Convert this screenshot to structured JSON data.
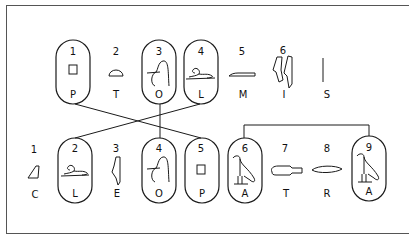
{
  "diagram": {
    "title": "",
    "top_row": [
      {
        "num": "1",
        "letter": "P",
        "glyph": "square-stool-icon",
        "cartouche": true,
        "x": 73
      },
      {
        "num": "2",
        "letter": "T",
        "glyph": "bread-loaf-icon",
        "cartouche": false,
        "x": 116
      },
      {
        "num": "3",
        "letter": "O",
        "glyph": "lasso-rope-icon",
        "cartouche": true,
        "x": 159
      },
      {
        "num": "4",
        "letter": "L",
        "glyph": "lion-icon",
        "cartouche": true,
        "x": 200
      },
      {
        "num": "5",
        "letter": "M",
        "glyph": "reed-mat-icon",
        "cartouche": false,
        "x": 242
      },
      {
        "num": "6",
        "letter": "I",
        "glyph": "double-reed-icon",
        "cartouche": false,
        "x": 283
      },
      {
        "num": "",
        "letter": "S",
        "glyph": "vertical-stroke-icon",
        "cartouche": false,
        "x": 327
      }
    ],
    "bottom_row": [
      {
        "num": "1",
        "letter": "C",
        "glyph": "hill-slope-icon",
        "cartouche": false,
        "x": 34
      },
      {
        "num": "2",
        "letter": "L",
        "glyph": "lion-icon",
        "cartouche": true,
        "x": 75
      },
      {
        "num": "3",
        "letter": "E",
        "glyph": "reed-leaf-icon",
        "cartouche": false,
        "x": 116
      },
      {
        "num": "4",
        "letter": "O",
        "glyph": "lasso-rope-icon",
        "cartouche": true,
        "x": 159
      },
      {
        "num": "5",
        "letter": "P",
        "glyph": "square-stool-icon",
        "cartouche": true,
        "x": 201
      },
      {
        "num": "6",
        "letter": "A",
        "glyph": "vulture-icon",
        "cartouche": true,
        "x": 245
      },
      {
        "num": "7",
        "letter": "T",
        "glyph": "hand-icon",
        "cartouche": false,
        "x": 285
      },
      {
        "num": "8",
        "letter": "R",
        "glyph": "mouth-icon",
        "cartouche": false,
        "x": 327
      },
      {
        "num": "9",
        "letter": "A",
        "glyph": "vulture-icon",
        "cartouche": true,
        "x": 369
      }
    ],
    "connections": [
      {
        "from": "top.P1",
        "to": "bottom.P5"
      },
      {
        "from": "top.L4",
        "to": "bottom.L2"
      },
      {
        "from": "top.O3",
        "to": "bottom.O4"
      },
      {
        "from": "bottom.A6",
        "to": "bottom.A9",
        "type": "bracket"
      }
    ]
  }
}
